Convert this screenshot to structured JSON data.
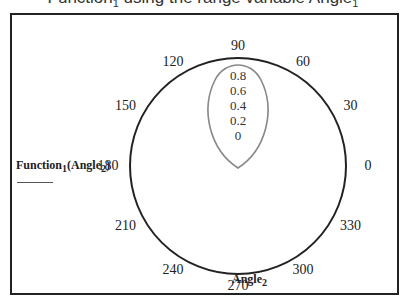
{
  "title": {
    "prefix": "Function",
    "sub1": "1",
    "middle": " using the range variable Angle",
    "sub2": "1"
  },
  "ylabel": {
    "main": "Function",
    "sub": "1",
    "arg": "(Angle",
    "argsub": "2",
    "close": ")"
  },
  "xlabel": {
    "main": "Angle",
    "sub": "2"
  },
  "angle_ticks": [
    "0",
    "30",
    "60",
    "90",
    "120",
    "150",
    "180",
    "210",
    "240",
    "270",
    "300",
    "330"
  ],
  "radial_ticks": [
    "0.8",
    "0.6",
    "0.4",
    "0.2",
    "0"
  ],
  "colors": {
    "outer_circle": "#222222",
    "curve": "#888888",
    "frame": "#222222"
  },
  "chart_data": {
    "type": "polar",
    "title": "Function1 using the range variable Angle1",
    "xlabel": "Angle2",
    "ylabel": "Function1(Angle2)",
    "angle_ticks_deg": [
      0,
      30,
      60,
      90,
      120,
      150,
      180,
      210,
      240,
      270,
      300,
      330
    ],
    "radial_ticks": [
      0,
      0.2,
      0.4,
      0.6,
      0.8
    ],
    "radial_range": [
      0,
      0.8
    ],
    "series": [
      {
        "name": "Function1",
        "description": "Cardioid-like loop from origin upward (peak r≈0.8 at 90°)",
        "theta_deg": [
          0,
          30,
          60,
          90,
          120,
          150,
          180
        ],
        "r": [
          0,
          0.4,
          0.69,
          0.8,
          0.69,
          0.4,
          0
        ]
      }
    ],
    "grid": false
  }
}
